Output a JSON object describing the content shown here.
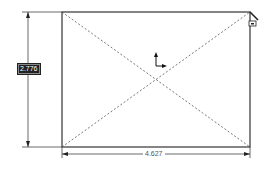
{
  "sketch": {
    "rectangle": {
      "x": 62,
      "y": 12,
      "width": 188,
      "height": 135
    },
    "dimensions": {
      "height_value": "2.776",
      "width_value": "4.627"
    },
    "colors": {
      "line": "#333333",
      "construction": "#555555",
      "dimension": "#444444"
    }
  }
}
